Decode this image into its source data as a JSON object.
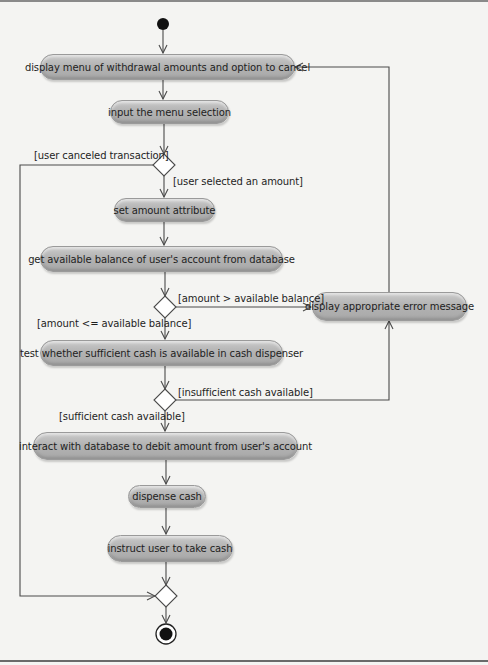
{
  "diagram": {
    "type": "UML activity diagram",
    "start_node": {
      "icon": "initial-state-icon"
    },
    "final_node": {
      "icon": "final-state-icon"
    },
    "actions": [
      {
        "id": "a1",
        "label": "display menu of withdrawal amounts and option to cancel"
      },
      {
        "id": "a2",
        "label": "input the menu selection"
      },
      {
        "id": "a3",
        "label": "set amount attribute"
      },
      {
        "id": "a4",
        "label": "get available balance of user's account from database"
      },
      {
        "id": "a5",
        "label": "display appropriate error message"
      },
      {
        "id": "a6",
        "label": "test whether sufficient cash is available in cash dispenser"
      },
      {
        "id": "a7",
        "label": "interact with database to debit amount from user's account"
      },
      {
        "id": "a8",
        "label": "dispense cash"
      },
      {
        "id": "a9",
        "label": "instruct user to take cash"
      }
    ],
    "guards": [
      {
        "id": "g1",
        "label": "[user canceled transaction]"
      },
      {
        "id": "g2",
        "label": "[user selected an amount]"
      },
      {
        "id": "g3",
        "label": "[amount > available balance]"
      },
      {
        "id": "g4",
        "label": "[amount <= available balance]"
      },
      {
        "id": "g5",
        "label": "[insufficient cash available]"
      },
      {
        "id": "g6",
        "label": "[sufficient cash available]"
      }
    ],
    "colors": {
      "action_fill": "#b3b3b3",
      "line": "#4a4a4a",
      "background": "#f4f4f2"
    }
  }
}
